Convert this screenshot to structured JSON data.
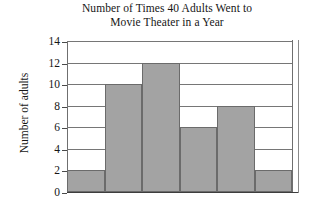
{
  "chart_data": {
    "type": "bar",
    "title": "Number of Times 40 Adults Went to\nMovie Theater in a Year",
    "xlabel": "",
    "ylabel": "Number of adults",
    "categories": [
      "1",
      "2",
      "3",
      "4",
      "5",
      "6"
    ],
    "values": [
      2,
      10,
      12,
      6,
      8,
      2
    ],
    "ylim": [
      0,
      14
    ],
    "ytick_labels": [
      "14",
      "12",
      "10",
      "8",
      "6",
      "4",
      "2",
      "0"
    ],
    "ytick_values": [
      14,
      12,
      10,
      8,
      6,
      4,
      2,
      0
    ],
    "ystep": 2,
    "grid": "horizontal",
    "legend": "none",
    "bar_fill_color": "#a3a3a3",
    "bar_edge_color": "#6b6b6b",
    "axis_color": "#4a4a4a",
    "note": "Histogram with adjacent bars; x-axis tick labels are cropped off the bottom of the image"
  },
  "figure": {
    "background_color": "#ffffff"
  }
}
